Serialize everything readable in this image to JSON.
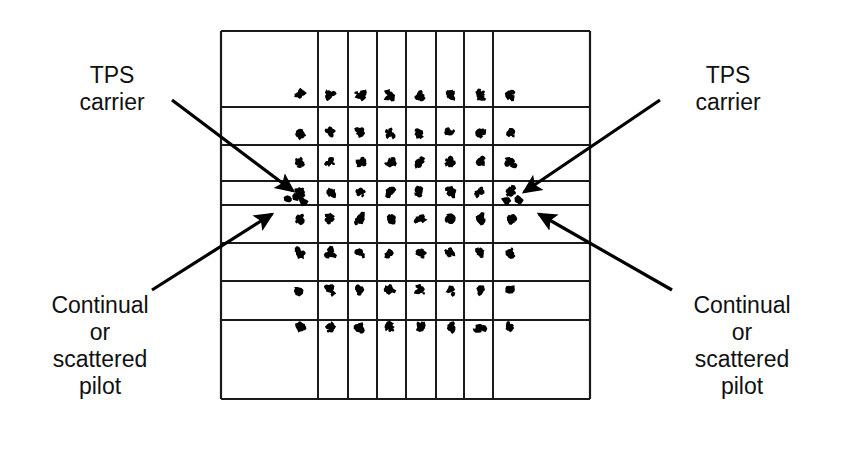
{
  "figure": {
    "type": "constellation-diagram"
  },
  "labels": {
    "tps_left": {
      "name": "TPS carrier",
      "lines": [
        "TPS",
        "carrier"
      ]
    },
    "tps_right": {
      "name": "TPS carrier",
      "lines": [
        "TPS",
        "carrier"
      ]
    },
    "pilot_left": {
      "name": "Continual or scattered pilot",
      "lines": [
        "Continual",
        "or",
        "scattered",
        "pilot"
      ]
    },
    "pilot_right": {
      "name": "Continual or scattered pilot",
      "lines": [
        "Continual",
        "or",
        "scattered",
        "pilot"
      ]
    }
  },
  "colors": {
    "ink": "#000000",
    "grid": "#1a1a1a",
    "background": "#ffffff"
  },
  "chart_data": {
    "type": "scatter",
    "title": "",
    "xlabel": "",
    "ylabel": "",
    "grid": true,
    "legend_position": "none",
    "plot_box": {
      "x": 221,
      "y": 31,
      "width": 370,
      "height": 369
    },
    "grid_lines": {
      "vertical": [
        221,
        318,
        348,
        377,
        406,
        436,
        464,
        493,
        590
      ],
      "horizontal": [
        31,
        107,
        145,
        181,
        205,
        243,
        281,
        320,
        399
      ]
    },
    "cluster_columns_x": [
      300,
      330,
      360,
      390,
      420,
      450,
      480,
      510
    ],
    "cluster_rows_y": [
      95,
      133,
      162,
      192,
      219,
      253,
      290,
      327
    ],
    "cluster_points_per_cell": 9,
    "cluster_jitter_px": 4,
    "marker_size_px": 7,
    "special_markers": [
      {
        "name": "tps-carrier-left",
        "x": 303,
        "y": 201
      },
      {
        "name": "tps-carrier-left-2",
        "x": 295,
        "y": 197
      },
      {
        "name": "pilot-left",
        "x": 288,
        "y": 199
      },
      {
        "name": "tps-carrier-right",
        "x": 506,
        "y": 201
      },
      {
        "name": "pilot-right",
        "x": 519,
        "y": 200
      }
    ],
    "annotations": [
      {
        "name": "arrow-tps-left",
        "from": [
          172,
          100
        ],
        "to": [
          293,
          191
        ]
      },
      {
        "name": "arrow-pilot-left",
        "from": [
          152,
          290
        ],
        "to": [
          272,
          214
        ]
      },
      {
        "name": "arrow-tps-right",
        "from": [
          660,
          100
        ],
        "to": [
          524,
          192
        ]
      },
      {
        "name": "arrow-pilot-right",
        "from": [
          672,
          290
        ],
        "to": [
          539,
          214
        ]
      }
    ]
  }
}
